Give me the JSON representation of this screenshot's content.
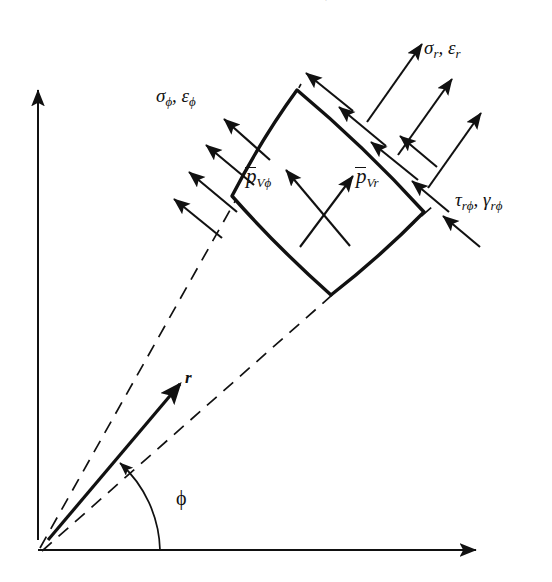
{
  "figure": {
    "type": "engineering-diagram",
    "background_color": "#ffffff",
    "ink_color": "#111111"
  },
  "axes": {
    "vertical": {
      "name": "vertical-axis",
      "from": [
        38,
        540
      ],
      "to": [
        38,
        88
      ],
      "style": "solid-arrow"
    },
    "horizontal": {
      "name": "horizontal-axis",
      "from": [
        38,
        550
      ],
      "to": [
        478,
        550
      ],
      "style": "solid-arrow"
    },
    "origin": [
      38,
      550
    ]
  },
  "labels": {
    "sigma_phi": {
      "base": "σ",
      "sub1": "ϕ",
      "sep": ", ",
      "base2": "ε",
      "sub2": "ϕ",
      "full": "σϕ, εϕ"
    },
    "sigma_r": {
      "base": "σ",
      "sub1": "r",
      "sep": ", ",
      "base2": "ε",
      "sub2": "r",
      "full": "σr, εr"
    },
    "tau_rphi": {
      "base": "τ",
      "sub1": "rϕ",
      "sep": ", ",
      "base2": "γ",
      "sub2": "rϕ",
      "full": "τrϕ, γrϕ"
    },
    "p_v_phi": {
      "base": "p",
      "sub": "Vϕ",
      "overbar": true,
      "full": "p̄Vϕ"
    },
    "p_v_r": {
      "base": "p",
      "sub": "Vr",
      "overbar": true,
      "full": "p̄Vr"
    },
    "r_vector": "r",
    "phi_angle": "ϕ",
    "top_fragment": "′"
  },
  "element": {
    "name": "curvilinear-sector-element",
    "corners": {
      "top": [
        297,
        90
      ],
      "left": [
        232,
        196
      ],
      "right": [
        424,
        212
      ],
      "bottom": [
        331,
        295
      ]
    },
    "edges": [
      {
        "name": "outer-arc",
        "from": "left",
        "to": "top",
        "curved": true
      },
      {
        "name": "upper-right-face",
        "from": "top",
        "to": "right",
        "curved": true
      },
      {
        "name": "inner-arc",
        "from": "right",
        "to": "bottom",
        "curved": true
      },
      {
        "name": "lower-left-face",
        "from": "bottom",
        "to": "left",
        "curved": true
      }
    ]
  },
  "sector_boundaries": [
    {
      "name": "dashed-radial-upper",
      "from": [
        38,
        550
      ],
      "to": [
        300,
        86
      ]
    },
    {
      "name": "dashed-radial-lower",
      "from": [
        38,
        550
      ],
      "to": [
        430,
        208
      ]
    }
  ],
  "vectors": {
    "r": {
      "name": "r-vector",
      "from": [
        48,
        540
      ],
      "to": [
        183,
        381
      ],
      "style": "bold-solid-arrow"
    },
    "p_v_r": {
      "name": "body-force-r-arrow",
      "from": [
        300,
        245
      ],
      "to": [
        352,
        178
      ],
      "style": "solid-arrow"
    },
    "p_v_phi": {
      "name": "body-force-phi-arrow",
      "from": [
        348,
        244
      ],
      "to": [
        287,
        172
      ],
      "style": "solid-arrow"
    }
  },
  "arrow_groups": {
    "sigma_phi_arrows": {
      "count": 4,
      "direction": "up-left",
      "face": "lower-left-face",
      "label_ref": "sigma_phi"
    },
    "sigma_r_arrows": {
      "count": 3,
      "direction": "up-right",
      "face": "upper-right-face",
      "label_ref": "sigma_r"
    },
    "tau_rphi_right_arrows": {
      "count": 3,
      "direction": "up-left",
      "face": "upper-right-face",
      "label_ref": "tau_rphi"
    },
    "tau_top_arrows": {
      "count": 3,
      "direction": "up-left",
      "face": "outer-arc",
      "label_ref": "tau_rphi"
    }
  },
  "phi_arc": {
    "name": "phi-angle-arc",
    "center": [
      38,
      550
    ],
    "radius": 122,
    "start_deg": 0,
    "end_deg": 50,
    "arrowhead": "end"
  }
}
